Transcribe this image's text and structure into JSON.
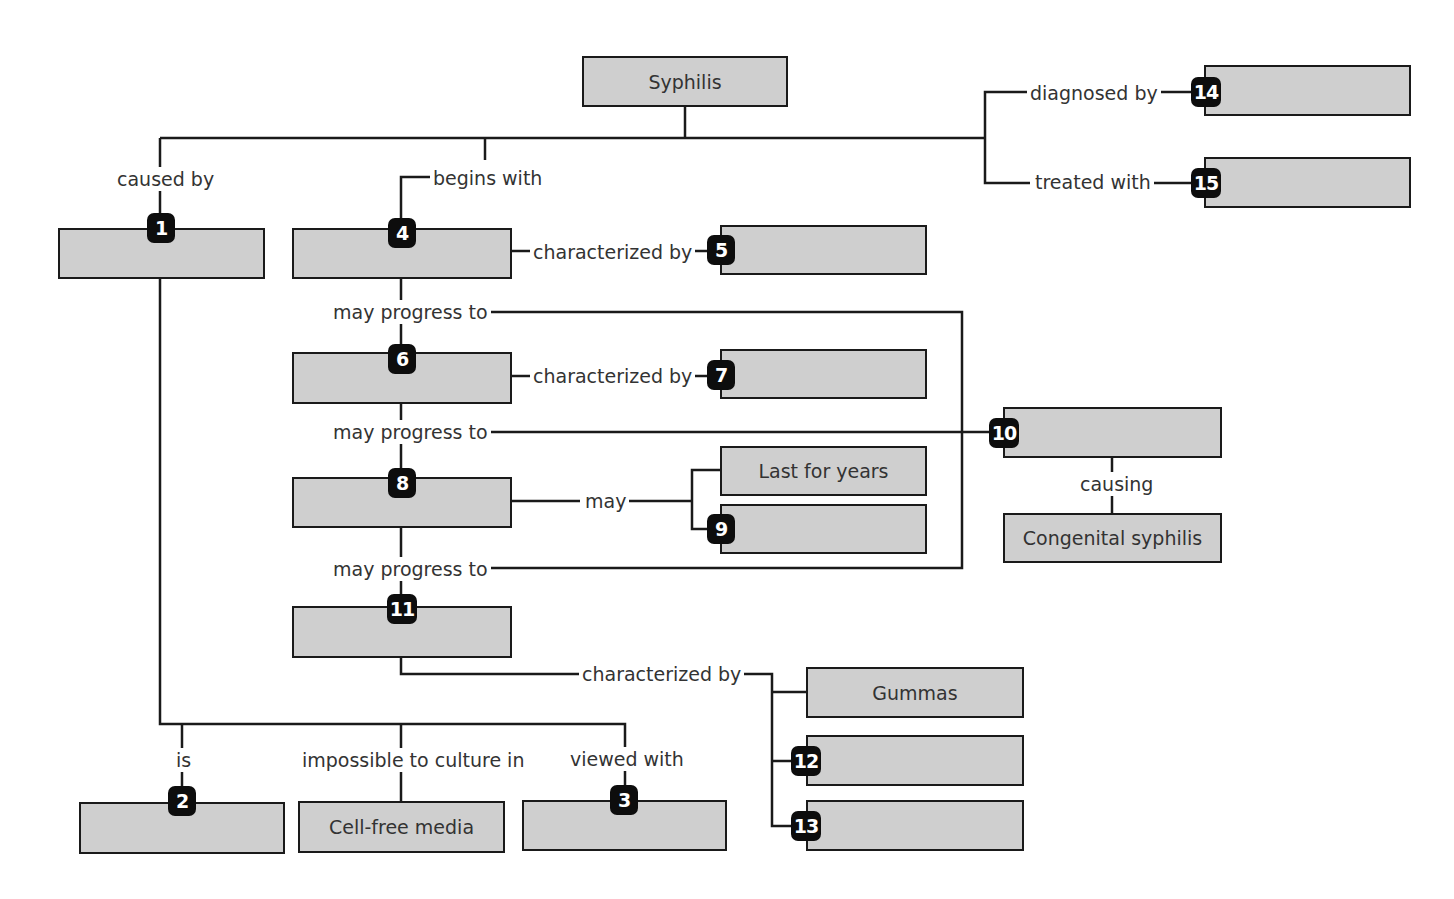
{
  "diagram": {
    "title": "Syphilis",
    "nodes": {
      "root": {
        "label": "Syphilis"
      },
      "n1": {
        "badge": "1",
        "label": ""
      },
      "n2": {
        "badge": "2",
        "label": ""
      },
      "n3": {
        "badge": "3",
        "label": ""
      },
      "cellfree": {
        "label": "Cell-free media"
      },
      "n4": {
        "badge": "4",
        "label": ""
      },
      "n5": {
        "badge": "5",
        "label": ""
      },
      "n6": {
        "badge": "6",
        "label": ""
      },
      "n7": {
        "badge": "7",
        "label": ""
      },
      "n8": {
        "badge": "8",
        "label": ""
      },
      "lastyears": {
        "label": "Last for years"
      },
      "n9": {
        "badge": "9",
        "label": ""
      },
      "n10": {
        "badge": "10",
        "label": ""
      },
      "congenital": {
        "label": "Congenital syphilis"
      },
      "n11": {
        "badge": "11",
        "label": ""
      },
      "gummas": {
        "label": "Gummas"
      },
      "n12": {
        "badge": "12",
        "label": ""
      },
      "n13": {
        "badge": "13",
        "label": ""
      },
      "n14": {
        "badge": "14",
        "label": ""
      },
      "n15": {
        "badge": "15",
        "label": ""
      }
    },
    "links": {
      "caused_by": "caused by",
      "begins_with": "begins with",
      "diagnosed_by": "diagnosed by",
      "treated_with": "treated with",
      "char_by_4": "characterized by",
      "char_by_6": "characterized by",
      "char_by_11": "characterized by",
      "progress_1": "may progress to",
      "progress_2": "may progress to",
      "progress_3": "may progress to",
      "may": "may",
      "causing": "causing",
      "is": "is",
      "impossible": "impossible to culture in",
      "viewed_with": "viewed with"
    }
  }
}
